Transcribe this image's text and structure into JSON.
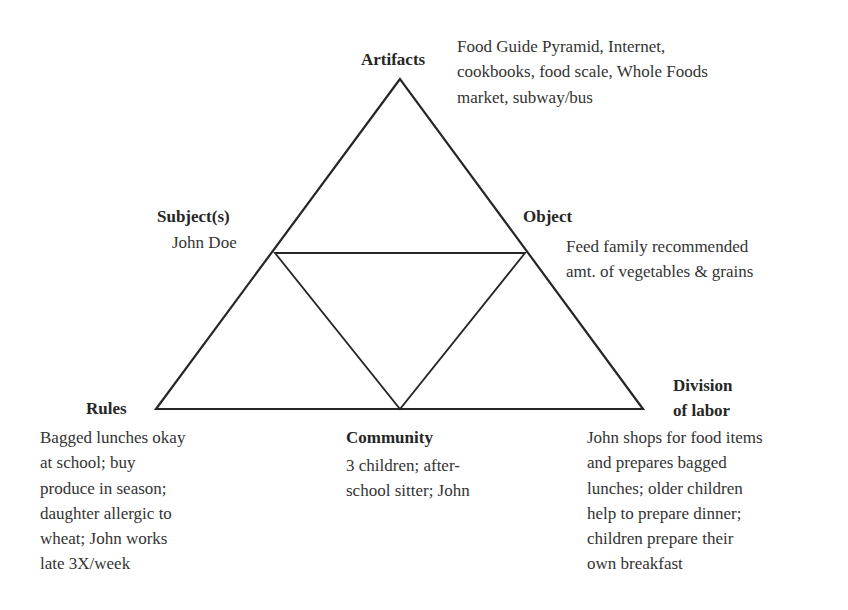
{
  "diagram": {
    "type": "activity-theory-triangle",
    "line_color": "#262626",
    "text_color": "#333333",
    "nodes": {
      "artifacts": {
        "label": "Artifacts",
        "description_lines": [
          "Food Guide Pyramid, Internet,",
          "cookbooks, food scale, Whole Foods",
          "market, subway/bus"
        ]
      },
      "subject": {
        "label": "Subject(s)",
        "description_lines": [
          "John Doe"
        ]
      },
      "object": {
        "label": "Object",
        "description_lines": [
          "Feed family recommended",
          "amt. of vegetables & grains"
        ]
      },
      "rules": {
        "label": "Rules",
        "description_lines": [
          "Bagged lunches okay",
          "at school; buy",
          "produce in season;",
          "daughter allergic to",
          "wheat; John works",
          "late 3X/week"
        ]
      },
      "community": {
        "label": "Community",
        "description_lines": [
          "3 children; after-",
          "school sitter; John"
        ]
      },
      "division_of_labor": {
        "label_lines": [
          "Division",
          "of labor"
        ],
        "description_lines": [
          "John shops for food items",
          "and prepares bagged",
          "lunches; older children",
          "help to prepare dinner;",
          "children prepare their",
          "own breakfast"
        ]
      }
    },
    "geometry": {
      "outer_triangle": [
        [
          400,
          79
        ],
        [
          156,
          409
        ],
        [
          643,
          409
        ]
      ],
      "inner_triangle": [
        [
          275,
          253
        ],
        [
          525,
          253
        ],
        [
          400,
          409
        ]
      ]
    }
  }
}
